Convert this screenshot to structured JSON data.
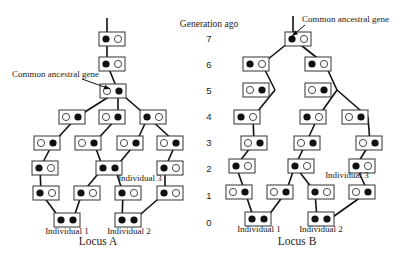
{
  "generation_axis": {
    "label": "Generation ago",
    "ticks": [
      {
        "label": "7",
        "y": 42
      },
      {
        "label": "6",
        "y": 68
      },
      {
        "label": "5",
        "y": 94
      },
      {
        "label": "4",
        "y": 120
      },
      {
        "label": "3",
        "y": 146
      },
      {
        "label": "2",
        "y": 172
      },
      {
        "label": "1",
        "y": 199
      },
      {
        "label": "0",
        "y": 226
      }
    ]
  },
  "loci": [
    {
      "name": "Locus A",
      "caption_pos": [
        98,
        245
      ],
      "annotation": {
        "text": "Common ancestral gene",
        "text_pos": [
          12,
          77
        ],
        "arrow_from": [
          82,
          79
        ],
        "arrow_to": [
          110,
          89
        ]
      },
      "root_line": {
        "x": 107,
        "y1": 18,
        "y2": 39
      },
      "individual_labels": [
        {
          "text": "Individual 1",
          "pos": [
            67,
            234
          ]
        },
        {
          "text": "Individual 2",
          "pos": [
            129,
            234
          ]
        },
        {
          "text": "Individual 3",
          "pos": [
            140,
            181
          ]
        }
      ],
      "boxes": [
        {
          "gen": 7,
          "cx": 112,
          "cy": 39,
          "left": "filled",
          "right": "open"
        },
        {
          "gen": 6,
          "cx": 112,
          "cy": 64,
          "left": "filled",
          "right": "open"
        },
        {
          "gen": 5,
          "cx": 113,
          "cy": 91,
          "left": "open",
          "right": "filled"
        },
        {
          "gen": 4,
          "cx": 72,
          "cy": 117,
          "left": "open",
          "right": "filled"
        },
        {
          "gen": 4,
          "cx": 112,
          "cy": 117,
          "left": "open",
          "right": "filled"
        },
        {
          "gen": 4,
          "cx": 153,
          "cy": 117,
          "left": "filled",
          "right": "open"
        },
        {
          "gen": 3,
          "cx": 47,
          "cy": 143,
          "left": "open",
          "right": "filled"
        },
        {
          "gen": 3,
          "cx": 88,
          "cy": 143,
          "left": "open",
          "right": "filled"
        },
        {
          "gen": 3,
          "cx": 130,
          "cy": 143,
          "left": "open",
          "right": "filled"
        },
        {
          "gen": 3,
          "cx": 170,
          "cy": 143,
          "left": "open",
          "right": "filled"
        },
        {
          "gen": 2,
          "cx": 45,
          "cy": 168,
          "left": "filled",
          "right": "open"
        },
        {
          "gen": 2,
          "cx": 109,
          "cy": 168,
          "left": "filled",
          "right": "filled"
        },
        {
          "gen": 2,
          "cx": 170,
          "cy": 168,
          "left": "filled",
          "right": "open"
        },
        {
          "gen": 1,
          "cx": 46,
          "cy": 193,
          "left": "filled",
          "right": "open"
        },
        {
          "gen": 1,
          "cx": 87,
          "cy": 193,
          "left": "filled",
          "right": "open"
        },
        {
          "gen": 1,
          "cx": 128,
          "cy": 193,
          "left": "filled",
          "right": "open"
        },
        {
          "gen": 1,
          "cx": 170,
          "cy": 193,
          "left": "filled",
          "right": "open"
        },
        {
          "gen": 0,
          "cx": 67,
          "cy": 220,
          "left": "filled",
          "right": "filled"
        },
        {
          "gen": 0,
          "cx": 128,
          "cy": 220,
          "left": "filled",
          "right": "filled"
        }
      ],
      "edges": [
        [
          107,
          39,
          107,
          64
        ],
        [
          107,
          64,
          118,
          91
        ],
        [
          118,
          91,
          77,
          117
        ],
        [
          118,
          91,
          118,
          117
        ],
        [
          118,
          91,
          148,
          117
        ],
        [
          77,
          117,
          53,
          143
        ],
        [
          118,
          117,
          94,
          143
        ],
        [
          148,
          117,
          136,
          143
        ],
        [
          148,
          117,
          176,
          143
        ],
        [
          53,
          143,
          40,
          168
        ],
        [
          94,
          143,
          103,
          168
        ],
        [
          136,
          143,
          115,
          168
        ],
        [
          176,
          143,
          165,
          168
        ],
        [
          40,
          168,
          41,
          193
        ],
        [
          103,
          168,
          82,
          193
        ],
        [
          115,
          168,
          123,
          193
        ],
        [
          165,
          168,
          165,
          193
        ],
        [
          41,
          193,
          61,
          220
        ],
        [
          82,
          193,
          73,
          220
        ],
        [
          123,
          193,
          122,
          220
        ],
        [
          165,
          193,
          134,
          220
        ]
      ]
    },
    {
      "name": "Locus B",
      "caption_pos": [
        297,
        245
      ],
      "annotation": {
        "text": "Common ancestral gene",
        "text_pos": [
          302,
          22
        ],
        "arrow_from": [
          305,
          25
        ],
        "arrow_to": [
          292,
          36
        ]
      },
      "root_line": {
        "x": 293,
        "y1": 16,
        "y2": 39
      },
      "individual_labels": [
        {
          "text": "Individual 1",
          "pos": [
            259,
            232
          ]
        },
        {
          "text": "Individual 2",
          "pos": [
            321,
            232
          ]
        },
        {
          "text": "Individual 3",
          "pos": [
            347,
            178
          ]
        }
      ],
      "boxes": [
        {
          "gen": 7,
          "cx": 298,
          "cy": 39,
          "left": "filled",
          "right": "open"
        },
        {
          "gen": 6,
          "cx": 256,
          "cy": 64,
          "left": "filled",
          "right": "open"
        },
        {
          "gen": 6,
          "cx": 318,
          "cy": 64,
          "left": "filled",
          "right": "open"
        },
        {
          "gen": 5,
          "cx": 256,
          "cy": 90,
          "left": "open",
          "right": "filled"
        },
        {
          "gen": 5,
          "cx": 318,
          "cy": 90,
          "left": "open",
          "right": "filled"
        },
        {
          "gen": 4,
          "cx": 247,
          "cy": 117,
          "left": "filled",
          "right": "open"
        },
        {
          "gen": 4,
          "cx": 313,
          "cy": 117,
          "left": "filled",
          "right": "open"
        },
        {
          "gen": 4,
          "cx": 355,
          "cy": 117,
          "left": "open",
          "right": "filled"
        },
        {
          "gen": 3,
          "cx": 254,
          "cy": 143,
          "left": "open",
          "right": "filled"
        },
        {
          "gen": 3,
          "cx": 307,
          "cy": 143,
          "left": "open",
          "right": "filled"
        },
        {
          "gen": 3,
          "cx": 369,
          "cy": 143,
          "left": "open",
          "right": "filled"
        },
        {
          "gen": 2,
          "cx": 242,
          "cy": 166,
          "left": "filled",
          "right": "open"
        },
        {
          "gen": 2,
          "cx": 301,
          "cy": 166,
          "left": "filled",
          "right": "open"
        },
        {
          "gen": 2,
          "cx": 362,
          "cy": 166,
          "left": "filled",
          "right": "open"
        },
        {
          "gen": 1,
          "cx": 239,
          "cy": 192,
          "left": "open",
          "right": "filled"
        },
        {
          "gen": 1,
          "cx": 280,
          "cy": 192,
          "left": "open",
          "right": "filled"
        },
        {
          "gen": 1,
          "cx": 321,
          "cy": 192,
          "left": "filled",
          "right": "open"
        },
        {
          "gen": 1,
          "cx": 362,
          "cy": 192,
          "left": "open",
          "right": "filled"
        },
        {
          "gen": 0,
          "cx": 258,
          "cy": 219,
          "left": "filled",
          "right": "filled"
        },
        {
          "gen": 0,
          "cx": 321,
          "cy": 219,
          "left": "filled",
          "right": "filled"
        }
      ],
      "edges": [
        [
          293,
          39,
          262,
          64
        ],
        [
          293,
          39,
          325,
          64
        ],
        [
          262,
          64,
          275,
          90
        ],
        [
          325,
          64,
          337,
          90
        ],
        [
          275,
          90,
          253,
          117
        ],
        [
          337,
          90,
          318,
          117
        ],
        [
          337,
          90,
          368,
          117
        ],
        [
          253,
          117,
          254,
          143
        ],
        [
          318,
          117,
          306,
          143
        ],
        [
          368,
          117,
          370,
          143
        ],
        [
          254,
          143,
          236,
          166
        ],
        [
          306,
          143,
          295,
          166
        ],
        [
          370,
          143,
          356,
          166
        ],
        [
          236,
          166,
          245,
          192
        ],
        [
          295,
          166,
          286,
          192
        ],
        [
          295,
          166,
          315,
          192
        ],
        [
          356,
          166,
          368,
          192
        ],
        [
          245,
          192,
          254,
          219
        ],
        [
          286,
          192,
          266,
          219
        ],
        [
          315,
          192,
          317,
          219
        ],
        [
          368,
          192,
          330,
          219
        ]
      ]
    }
  ]
}
